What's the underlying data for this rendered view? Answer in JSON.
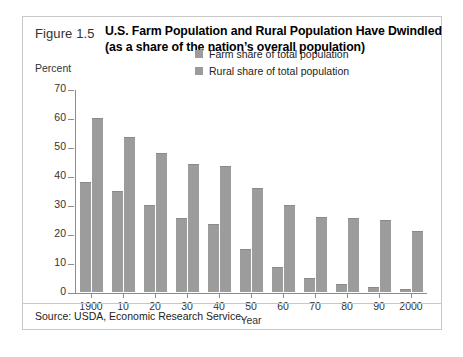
{
  "figure": {
    "number_label": "Figure 1.5",
    "title_line1": "U.S. Farm Population and Rural Population Have Dwindled",
    "title_line2": "(as a share of the nation’s overall population)",
    "source_note": "Source: USDA, Economic Research Service.",
    "bar_color": "#9c9c9c",
    "frame_color": "#c8c8c8",
    "axis_color": "#8c8c8c"
  },
  "chart_data": {
    "type": "bar",
    "title": "U.S. Farm Population and Rural Population Have Dwindled (as a share of the nation’s overall population)",
    "xlabel": "Year",
    "ylabel": "Percent",
    "ylim": [
      0,
      70
    ],
    "yticks": [
      0,
      10,
      20,
      30,
      40,
      50,
      60,
      70
    ],
    "ytick_labels": [
      "0",
      "10",
      "20",
      "30",
      "40",
      "50",
      "60",
      "70"
    ],
    "grid": false,
    "legend_position": "inside-top-center",
    "categories": [
      "1900",
      "10",
      "20",
      "30",
      "40",
      "50",
      "60",
      "70",
      "80",
      "90",
      "2000"
    ],
    "series": [
      {
        "name": "Farm share of total population",
        "values": [
          38,
          35,
          30,
          25.5,
          23.5,
          15,
          8.7,
          4.8,
          2.7,
          1.9,
          1.2
        ]
      },
      {
        "name": "Rural share of total population",
        "values": [
          60,
          53.5,
          48,
          44,
          43.5,
          36,
          30,
          26,
          25.5,
          25,
          21
        ]
      }
    ]
  }
}
